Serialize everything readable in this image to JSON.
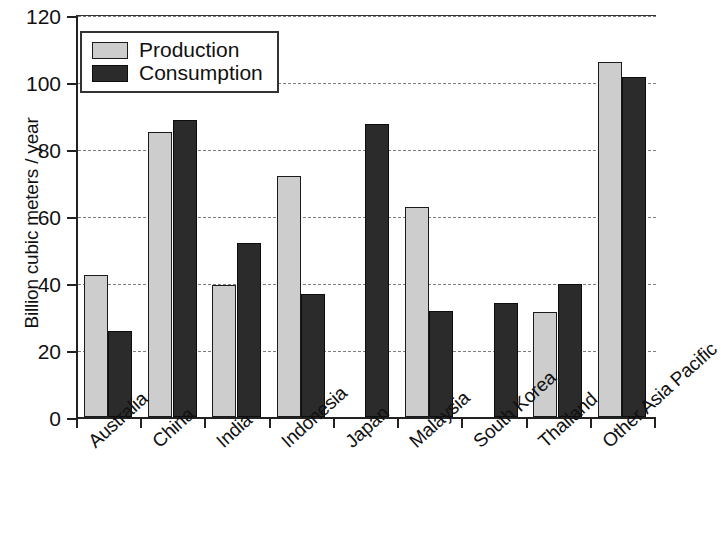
{
  "chart_data": {
    "type": "bar",
    "title": "",
    "xlabel": "",
    "ylabel": "Billion cubic meters / year",
    "ylim": [
      0,
      120
    ],
    "yticks": [
      0,
      20,
      40,
      60,
      80,
      100,
      120
    ],
    "grid": true,
    "legend_position": "top-left",
    "categories": [
      "Australia",
      "China",
      "India",
      "Indonesia",
      "Japan",
      "Malaysia",
      "South Korea",
      "Thailand",
      "Other Asia Pacific"
    ],
    "series": [
      {
        "name": "Production",
        "color": "#cdcdcd",
        "values": [
          42.3,
          85.0,
          39.5,
          72.0,
          null,
          62.8,
          null,
          31.2,
          106.0
        ]
      },
      {
        "name": "Consumption",
        "color": "#2b2b2b",
        "values": [
          25.8,
          88.6,
          52.0,
          36.6,
          87.6,
          31.7,
          34.0,
          39.6,
          101.6
        ]
      }
    ]
  },
  "legend": {
    "items": [
      {
        "label": "Production",
        "swatch": "light-gray"
      },
      {
        "label": "Consumption",
        "swatch": "dark-gray"
      }
    ]
  },
  "axes": {
    "y_title": "Billion cubic meters / year",
    "y_tick_labels": [
      "0",
      "20",
      "40",
      "60",
      "80",
      "100",
      "120"
    ]
  }
}
